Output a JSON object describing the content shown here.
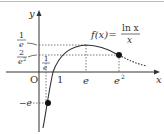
{
  "figure": {
    "function_label": {
      "lhs": "f(x)=",
      "numerator": "ln x",
      "denominator": "x"
    },
    "axes": {
      "x_label": "x",
      "y_label": "y",
      "origin_label": "O"
    },
    "x_ticks": [
      "1/e",
      "1",
      "e",
      "e²"
    ],
    "x_tick_labels": {
      "inv_e_num": "1",
      "inv_e_den": "e",
      "one": "1",
      "e": "e",
      "e2_base": "e",
      "e2_exp": "2"
    },
    "y_ticks": [
      "1/e",
      "2/e²",
      "−e"
    ],
    "y_tick_labels": {
      "inv_e_num": "1",
      "inv_e_den": "e",
      "two_e2_num": "2",
      "two_e2_den": "e",
      "two_e2_exp": "2",
      "neg_e": "−e"
    },
    "points": [
      {
        "label": "(1/e, −e)",
        "x": "1/e",
        "y": "−e"
      },
      {
        "label": "(e², 2/e²)",
        "x": "e²",
        "y": "2/e²"
      }
    ],
    "colors": {
      "curve": "#333333",
      "axis": "#333333",
      "dotted": "#555555"
    }
  }
}
